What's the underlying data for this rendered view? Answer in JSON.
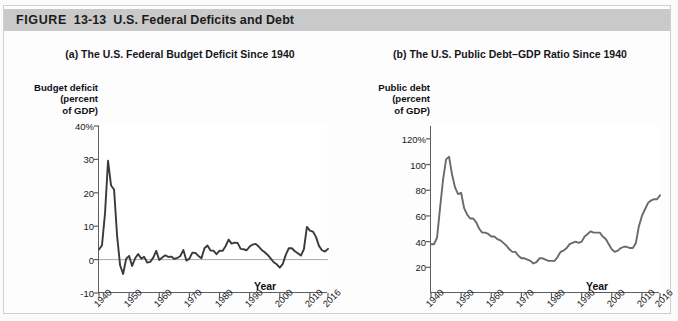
{
  "figure": {
    "label_word": "FIGURE",
    "number": "13-13",
    "title": "U.S. Federal Deficits and Debt",
    "banner_color": "#c9c9c9"
  },
  "panel_a": {
    "title": "(a) The U.S. Federal Budget Deficit Since 1940",
    "y_axis_title_lines": [
      "Budget deficit",
      "(percent",
      "of GDP)"
    ],
    "x_axis_name": "Year",
    "line_color": "#3a3a3a"
  },
  "panel_b": {
    "title": "(b) The U.S. Public Debt–GDP Ratio Since 1940",
    "y_axis_title_lines": [
      "Public debt",
      "(percent",
      "of GDP)"
    ],
    "x_axis_name": "Year",
    "line_color": "#6a6a6a"
  },
  "chart_data": [
    {
      "type": "line",
      "title": "(a) The U.S. Federal Budget Deficit Since 1940",
      "xlabel": "Year",
      "ylabel": "Budget deficit (percent of GDP)",
      "ylim": [
        -10,
        40
      ],
      "xlim": [
        1940,
        2016
      ],
      "yticks": [
        40,
        30,
        20,
        10,
        0,
        -10
      ],
      "ytick_labels": [
        "40%",
        "30",
        "20",
        "10",
        "0",
        "-10"
      ],
      "xticks": [
        1940,
        1950,
        1960,
        1970,
        1980,
        1990,
        2000,
        2010,
        2016
      ],
      "xtick_labels": [
        "1940",
        "1950",
        "1960",
        "1970",
        "1980",
        "1990",
        "2000",
        "2010",
        "2016"
      ],
      "grid": false,
      "legend": "none",
      "zero_line": true,
      "series": [
        {
          "name": "Federal budget deficit as percent of GDP",
          "x": [
            1940,
            1941,
            1942,
            1943,
            1944,
            1945,
            1946,
            1947,
            1948,
            1949,
            1950,
            1951,
            1952,
            1953,
            1954,
            1955,
            1956,
            1957,
            1958,
            1959,
            1960,
            1961,
            1962,
            1963,
            1964,
            1965,
            1966,
            1967,
            1968,
            1969,
            1970,
            1971,
            1972,
            1973,
            1974,
            1975,
            1976,
            1977,
            1978,
            1979,
            1980,
            1981,
            1982,
            1983,
            1984,
            1985,
            1986,
            1987,
            1988,
            1989,
            1990,
            1991,
            1992,
            1993,
            1994,
            1995,
            1996,
            1997,
            1998,
            1999,
            2000,
            2001,
            2002,
            2003,
            2004,
            2005,
            2006,
            2007,
            2008,
            2009,
            2010,
            2011,
            2012,
            2013,
            2014,
            2015,
            2016
          ],
          "values": [
            3.0,
            4.3,
            13.9,
            29.6,
            22.2,
            21.0,
            7.2,
            -1.7,
            -4.3,
            0.2,
            1.1,
            -1.9,
            0.4,
            1.7,
            0.3,
            0.8,
            -0.9,
            -0.7,
            0.6,
            2.6,
            -0.1,
            0.6,
            1.3,
            0.8,
            0.9,
            0.2,
            0.5,
            1.1,
            2.9,
            -0.3,
            0.3,
            2.1,
            2.0,
            1.1,
            0.4,
            3.4,
            4.2,
            2.7,
            2.7,
            1.6,
            2.7,
            2.6,
            4.0,
            6.0,
            4.8,
            5.1,
            5.0,
            3.2,
            3.1,
            2.8,
            3.9,
            4.5,
            4.7,
            3.9,
            2.9,
            2.2,
            1.4,
            0.3,
            -0.8,
            -1.4,
            -2.4,
            -1.3,
            1.5,
            3.4,
            3.4,
            2.5,
            1.9,
            1.2,
            3.1,
            9.8,
            8.7,
            8.4,
            6.8,
            4.1,
            2.8,
            2.4,
            3.2
          ]
        }
      ]
    },
    {
      "type": "line",
      "title": "(b) The U.S. Public Debt–GDP Ratio Since 1940",
      "xlabel": "Year",
      "ylabel": "Public debt (percent of GDP)",
      "ylim": [
        0,
        130
      ],
      "xlim": [
        1940,
        2016
      ],
      "yticks": [
        120,
        100,
        80,
        60,
        40,
        20
      ],
      "ytick_labels": [
        "120%",
        "100",
        "80",
        "60",
        "40",
        "20"
      ],
      "xticks": [
        1940,
        1950,
        1960,
        1970,
        1980,
        1990,
        2000,
        2010,
        2016
      ],
      "xtick_labels": [
        "1940",
        "1950",
        "1960",
        "1970",
        "1980",
        "1990",
        "2000",
        "2010",
        "2016"
      ],
      "grid": false,
      "legend": "none",
      "series": [
        {
          "name": "Public debt as percent of GDP",
          "x": [
            1940,
            1941,
            1942,
            1943,
            1944,
            1945,
            1946,
            1947,
            1948,
            1949,
            1950,
            1951,
            1952,
            1953,
            1954,
            1955,
            1956,
            1957,
            1958,
            1959,
            1960,
            1961,
            1962,
            1963,
            1964,
            1965,
            1966,
            1967,
            1968,
            1969,
            1970,
            1971,
            1972,
            1973,
            1974,
            1975,
            1976,
            1977,
            1978,
            1979,
            1980,
            1981,
            1982,
            1983,
            1984,
            1985,
            1986,
            1987,
            1988,
            1989,
            1990,
            1991,
            1992,
            1993,
            1994,
            1995,
            1996,
            1997,
            1998,
            1999,
            2000,
            2001,
            2002,
            2003,
            2004,
            2005,
            2006,
            2007,
            2008,
            2009,
            2010,
            2011,
            2012,
            2013,
            2014,
            2015,
            2016
          ],
          "values": [
            38,
            38,
            43,
            66,
            88,
            104,
            106,
            92,
            82,
            77,
            78,
            66,
            61,
            58,
            58,
            55,
            50,
            47,
            47,
            46,
            44,
            44,
            42,
            41,
            39,
            37,
            34,
            32,
            32,
            29,
            27,
            27,
            26,
            25,
            23,
            24,
            27,
            27,
            26,
            25,
            25,
            25,
            28,
            32,
            33,
            35,
            38,
            39,
            40,
            39,
            40,
            44,
            46,
            48,
            47,
            47,
            47,
            44,
            42,
            38,
            34,
            32,
            33,
            35,
            36,
            36,
            35,
            35,
            39,
            52,
            60,
            65,
            70,
            72,
            73,
            73,
            76
          ]
        }
      ]
    }
  ]
}
